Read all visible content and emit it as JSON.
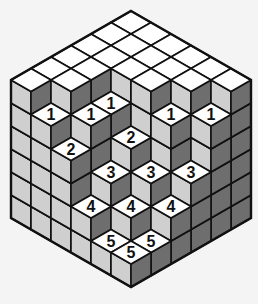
{
  "puzzle": {
    "title": "Isometric cube staircase puzzle",
    "grid_size": 6,
    "max_height": 6,
    "origin": {
      "x": 131,
      "y": 11
    },
    "dx": 20,
    "dy": 11.5,
    "dz": 23,
    "colors": {
      "background": "#f4f4f4",
      "top": "#ffffff",
      "left_face": "#cfcfcf",
      "right_face": "#6e6e6e",
      "stroke": "#111111"
    },
    "heights": [
      [
        6,
        6,
        6,
        6,
        6,
        6
      ],
      [
        6,
        6,
        6,
        6,
        6,
        5
      ],
      [
        6,
        6,
        6,
        5,
        5,
        4
      ],
      [
        6,
        6,
        6,
        4,
        3,
        2
      ],
      [
        6,
        6,
        5,
        3,
        2,
        1
      ],
      [
        6,
        5,
        3,
        2,
        1,
        1
      ]
    ],
    "labels": [
      {
        "i": 1,
        "j": 5,
        "text": "1"
      },
      {
        "i": 2,
        "j": 4,
        "text": "1"
      },
      {
        "i": 2,
        "j": 3,
        "text": "1"
      },
      {
        "i": 4,
        "j": 2,
        "text": "1"
      },
      {
        "i": 5,
        "j": 1,
        "text": "1"
      },
      {
        "i": 2,
        "j": 5,
        "text": "2"
      },
      {
        "i": 3,
        "j": 3,
        "text": "2"
      },
      {
        "i": 3,
        "j": 4,
        "text": "3"
      },
      {
        "i": 4,
        "j": 3,
        "text": "3"
      },
      {
        "i": 5,
        "j": 2,
        "text": "3"
      },
      {
        "i": 3,
        "j": 5,
        "text": "4"
      },
      {
        "i": 4,
        "j": 4,
        "text": "4"
      },
      {
        "i": 5,
        "j": 3,
        "text": "4"
      },
      {
        "i": 4,
        "j": 5,
        "text": "5"
      },
      {
        "i": 5,
        "j": 4,
        "text": "5"
      },
      {
        "i": 5,
        "j": 5,
        "text": "5"
      }
    ]
  }
}
